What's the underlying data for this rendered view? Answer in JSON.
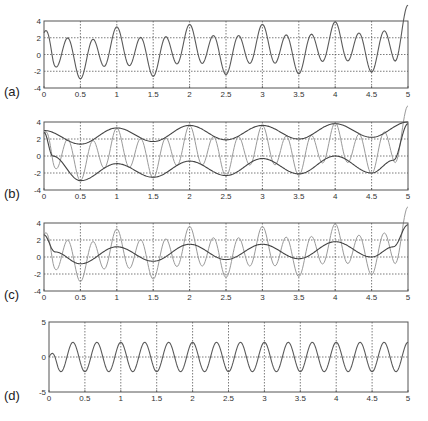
{
  "figure": {
    "background": "#ffffff",
    "axis_color": "#555555",
    "grid_color": "#444444",
    "signal_color": "#5a5a5a",
    "light_color": "#9a9a9a",
    "dark_color": "#444444"
  },
  "chart_data": [
    {
      "id": "a",
      "panel_label": "(a)",
      "type": "line",
      "title": "",
      "xlabel": "",
      "ylabel": "",
      "xlim": [
        0,
        5
      ],
      "ylim": [
        -4,
        4
      ],
      "xticks": [
        "0",
        "0.5",
        "1",
        "1.5",
        "2",
        "2.5",
        "3",
        "3.5",
        "4",
        "4.5",
        "5"
      ],
      "yticks": [
        "4",
        "2",
        "0",
        "-2",
        "-4"
      ],
      "ytick_values": [
        4,
        2,
        0,
        -2,
        -4
      ],
      "grid": true,
      "series": [
        {
          "name": "signal",
          "style": "signal",
          "components": [
            "slow",
            "fast"
          ]
        }
      ],
      "observed_extrema": {
        "peaks": [
          [
            1,
            3.2
          ],
          [
            2,
            3.5
          ],
          [
            3,
            3.5
          ],
          [
            4,
            3.8
          ],
          [
            5,
            4.0
          ]
        ],
        "troughs": [
          [
            0.5,
            -2.8
          ],
          [
            1.5,
            -2.5
          ],
          [
            2.5,
            -2.3
          ],
          [
            3.5,
            -2.1
          ],
          [
            4.5,
            -1.9
          ]
        ]
      }
    },
    {
      "id": "b",
      "panel_label": "(b)",
      "type": "line",
      "xlim": [
        0,
        5
      ],
      "ylim": [
        -4,
        4
      ],
      "xticks": [
        "0",
        "0.5",
        "1",
        "1.5",
        "2",
        "2.5",
        "3",
        "3.5",
        "4",
        "4.5",
        "5"
      ],
      "yticks": [
        "4",
        "2",
        "0",
        "-2",
        "-4"
      ],
      "ytick_values": [
        4,
        2,
        0,
        -2,
        -4
      ],
      "grid": true,
      "series": [
        {
          "name": "signal (thin)",
          "style": "light",
          "components": [
            "slow",
            "fast"
          ]
        },
        {
          "name": "upper envelope",
          "style": "dark",
          "knots": "upper_env"
        },
        {
          "name": "lower envelope",
          "style": "dark",
          "knots": "lower_env"
        }
      ]
    },
    {
      "id": "c",
      "panel_label": "(c)",
      "type": "line",
      "xlim": [
        0,
        5
      ],
      "ylim": [
        -4,
        4
      ],
      "xticks": [
        "0",
        "0.5",
        "1",
        "1.5",
        "2",
        "2.5",
        "3",
        "3.5",
        "4",
        "4.5",
        "5"
      ],
      "yticks": [
        "4",
        "2",
        "0",
        "-2",
        "-4"
      ],
      "ytick_values": [
        4,
        2,
        0,
        -2,
        -4
      ],
      "grid": true,
      "series": [
        {
          "name": "signal",
          "style": "light",
          "components": [
            "slow",
            "fast"
          ]
        },
        {
          "name": "envelope mean",
          "style": "dark",
          "components": [
            "slow"
          ]
        }
      ]
    },
    {
      "id": "d",
      "panel_label": "(d)",
      "type": "line",
      "xlim": [
        0,
        5
      ],
      "ylim": [
        -5,
        5
      ],
      "xticks": [
        "0",
        "0.5",
        "1",
        "1.5",
        "2",
        "2.5",
        "3",
        "3.5",
        "4",
        "4.5",
        "5"
      ],
      "yticks": [
        "5",
        "0",
        "-5"
      ],
      "ytick_values": [
        5,
        0,
        -5
      ],
      "grid": true,
      "series": [
        {
          "name": "detail (signal minus mean)",
          "style": "signal",
          "components": [
            "fast"
          ]
        }
      ]
    }
  ],
  "model": {
    "slow_knots": [
      [
        0,
        2.6
      ],
      [
        0.15,
        0.6
      ],
      [
        0.5,
        -0.8
      ],
      [
        1,
        1.2
      ],
      [
        1.5,
        -0.5
      ],
      [
        2,
        1.5
      ],
      [
        2.5,
        -0.3
      ],
      [
        3,
        1.5
      ],
      [
        3.5,
        -0.2
      ],
      [
        4,
        1.8
      ],
      [
        4.5,
        0.0
      ],
      [
        4.8,
        1.2
      ],
      [
        5,
        3.8
      ]
    ],
    "upper_env": [
      [
        0,
        3.0
      ],
      [
        0.5,
        1.4
      ],
      [
        1,
        3.3
      ],
      [
        1.5,
        1.7
      ],
      [
        2,
        3.6
      ],
      [
        2.5,
        1.9
      ],
      [
        3,
        3.6
      ],
      [
        3.5,
        2.0
      ],
      [
        4,
        3.8
      ],
      [
        4.5,
        2.2
      ],
      [
        5,
        4.0
      ]
    ],
    "lower_env": [
      [
        0,
        2.8
      ],
      [
        0.12,
        0.0
      ],
      [
        0.5,
        -2.9
      ],
      [
        1,
        -0.9
      ],
      [
        1.5,
        -2.5
      ],
      [
        2,
        -0.6
      ],
      [
        2.5,
        -2.3
      ],
      [
        3,
        -0.3
      ],
      [
        3.5,
        -2.1
      ],
      [
        4,
        0.0
      ],
      [
        4.5,
        -2.0
      ],
      [
        4.8,
        -0.5
      ],
      [
        5,
        3.8
      ]
    ],
    "fast_amplitude": 2.1,
    "fast_frequency": 3,
    "edge_ramp": 0.12,
    "samples": 400
  },
  "layout": {
    "panels": [
      {
        "id": "a",
        "left": 44,
        "top": 21,
        "right": 408,
        "bottom": 88,
        "label_x": 4,
        "label_y": 84
      },
      {
        "id": "b",
        "left": 44,
        "top": 122,
        "right": 408,
        "bottom": 190,
        "label_x": 4,
        "label_y": 186
      },
      {
        "id": "c",
        "left": 44,
        "top": 223,
        "right": 408,
        "bottom": 291,
        "label_x": 4,
        "label_y": 287
      },
      {
        "id": "d",
        "left": 49,
        "top": 322,
        "right": 408,
        "bottom": 392,
        "label_x": 4,
        "label_y": 388
      }
    ]
  }
}
